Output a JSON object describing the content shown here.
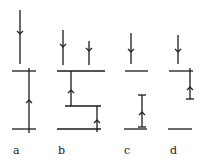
{
  "figure": {
    "panels": [
      {
        "label": "a",
        "label_pos": [
          13,
          145
        ],
        "lines": [
          {
            "x1": 20,
            "y1": 10,
            "x2": 20,
            "y2": 64
          },
          {
            "x1": 12,
            "y1": 71,
            "x2": 36,
            "y2": 71
          },
          {
            "x1": 29,
            "y1": 68,
            "x2": 29,
            "y2": 133
          },
          {
            "x1": 12,
            "y1": 129,
            "x2": 36,
            "y2": 129
          }
        ],
        "arrows": [
          {
            "x": 20,
            "y": 34,
            "dir": "down"
          },
          {
            "x": 29,
            "y": 100,
            "dir": "up"
          }
        ]
      },
      {
        "label": "b",
        "label_pos": [
          58,
          145
        ],
        "lines": [
          {
            "x1": 63,
            "y1": 30,
            "x2": 63,
            "y2": 65
          },
          {
            "x1": 89,
            "y1": 41,
            "x2": 89,
            "y2": 65
          },
          {
            "x1": 57,
            "y1": 71,
            "x2": 105,
            "y2": 71
          },
          {
            "x1": 71,
            "y1": 71,
            "x2": 71,
            "y2": 106
          },
          {
            "x1": 65,
            "y1": 106,
            "x2": 101,
            "y2": 106
          },
          {
            "x1": 97,
            "y1": 106,
            "x2": 97,
            "y2": 132
          },
          {
            "x1": 57,
            "y1": 129,
            "x2": 101,
            "y2": 129
          }
        ],
        "arrows": [
          {
            "x": 63,
            "y": 47,
            "dir": "down"
          },
          {
            "x": 89,
            "y": 51,
            "dir": "down"
          },
          {
            "x": 71,
            "y": 90,
            "dir": "up"
          },
          {
            "x": 97,
            "y": 120,
            "dir": "up"
          }
        ]
      },
      {
        "label": "c",
        "label_pos": [
          124,
          145
        ],
        "lines": [
          {
            "x1": 131,
            "y1": 33,
            "x2": 131,
            "y2": 64
          },
          {
            "x1": 125,
            "y1": 71,
            "x2": 148,
            "y2": 71
          },
          {
            "x1": 142,
            "y1": 95,
            "x2": 142,
            "y2": 127
          },
          {
            "x1": 138,
            "y1": 95,
            "x2": 146,
            "y2": 95
          },
          {
            "x1": 138,
            "y1": 127,
            "x2": 146,
            "y2": 127
          },
          {
            "x1": 124,
            "y1": 129,
            "x2": 147,
            "y2": 129
          }
        ],
        "arrows": [
          {
            "x": 131,
            "y": 52,
            "dir": "down"
          },
          {
            "x": 142,
            "y": 112,
            "dir": "up"
          }
        ]
      },
      {
        "label": "d",
        "label_pos": [
          170,
          145
        ],
        "lines": [
          {
            "x1": 178,
            "y1": 35,
            "x2": 178,
            "y2": 64
          },
          {
            "x1": 169,
            "y1": 71,
            "x2": 193,
            "y2": 71
          },
          {
            "x1": 190,
            "y1": 68,
            "x2": 190,
            "y2": 99
          },
          {
            "x1": 186,
            "y1": 99,
            "x2": 194,
            "y2": 99
          },
          {
            "x1": 168,
            "y1": 129,
            "x2": 192,
            "y2": 129
          }
        ],
        "arrows": [
          {
            "x": 178,
            "y": 52,
            "dir": "down"
          },
          {
            "x": 190,
            "y": 87,
            "dir": "up"
          }
        ]
      }
    ]
  }
}
